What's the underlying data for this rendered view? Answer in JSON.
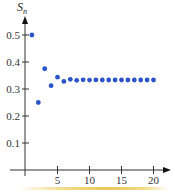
{
  "chart_data": {
    "type": "scatter",
    "title": "",
    "xlabel": "n",
    "ylabel": "S_n",
    "ylabel_main": "S",
    "ylabel_sub": "n",
    "x": [
      1,
      2,
      3,
      4,
      5,
      6,
      7,
      8,
      9,
      10,
      11,
      12,
      13,
      14,
      15,
      16,
      17,
      18,
      19,
      20
    ],
    "values": [
      0.5,
      0.25,
      0.375,
      0.3125,
      0.34375,
      0.328125,
      0.3359375,
      0.33203125,
      0.333984375,
      0.3330078125,
      0.33349609375,
      0.333251953125,
      0.3333740234375,
      0.33331298828125,
      0.333343505859375,
      0.3333282470703125,
      0.33333587646484375,
      0.3333320617675781,
      0.33333396911621094,
      0.3333330154418945
    ],
    "xticks": [
      5,
      10,
      15,
      20
    ],
    "xtick_labels": [
      "5",
      "10",
      "15",
      "20"
    ],
    "yticks": [
      0.1,
      0.2,
      0.3,
      0.4,
      0.5
    ],
    "ytick_labels": [
      "0.1",
      "0.2",
      "0.3",
      "0.4",
      "0.5"
    ],
    "xlim": [
      0,
      21
    ],
    "ylim": [
      0,
      0.55
    ],
    "grid": false,
    "legend": null,
    "marker_color": "#2a55c8"
  }
}
